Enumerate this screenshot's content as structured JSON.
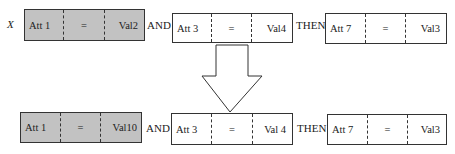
{
  "rule_before": {
    "variable": "X",
    "conditions": [
      {
        "attribute": "Att 1",
        "operator": "=",
        "value": "Val2",
        "highlighted": true
      },
      {
        "attribute": "Att 3",
        "operator": "=",
        "value": "Val4",
        "highlighted": false
      }
    ],
    "connector": "AND",
    "then_label": "THEN",
    "consequent": {
      "attribute": "Att 7",
      "operator": "=",
      "value": "Val3"
    }
  },
  "arrow": {
    "direction": "down"
  },
  "rule_after": {
    "conditions": [
      {
        "attribute": "Att 1",
        "operator": "=",
        "value": "Val10",
        "highlighted": true
      },
      {
        "attribute": "Att 3",
        "operator": "=",
        "value": "Val 4",
        "highlighted": false
      }
    ],
    "connector": "AND",
    "then_label": "THEN",
    "consequent": {
      "attribute": "Att 7",
      "operator": "=",
      "value": "Val3"
    }
  },
  "colors": {
    "highlight": "#c2c2c2",
    "border": "#333333"
  }
}
